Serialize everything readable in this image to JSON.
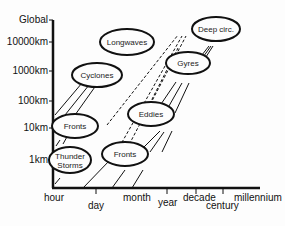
{
  "diagram": {
    "type": "space-time scale diagram",
    "y_axis": {
      "labels": [
        "Global",
        "10000km",
        "1000km",
        "100km",
        "10km",
        "1km"
      ]
    },
    "x_axis": {
      "labels": [
        "hour",
        "day",
        "month",
        "year",
        "decade",
        "century",
        "millennium"
      ]
    },
    "bubbles": [
      {
        "id": "thunderstorms",
        "label_line1": "Thunder",
        "label_line2": "Storms"
      },
      {
        "id": "fronts-atm",
        "label": "Fronts"
      },
      {
        "id": "cyclones",
        "label": "Cyclones"
      },
      {
        "id": "longwaves",
        "label": "Longwaves"
      },
      {
        "id": "fronts-ocean",
        "label": "Fronts"
      },
      {
        "id": "eddies",
        "label": "Eddies"
      },
      {
        "id": "gyres",
        "label": "Gyres"
      },
      {
        "id": "deep-circ",
        "label": "Deep circ."
      }
    ],
    "colors": {
      "line": "#111111",
      "background": "#fdfdfd"
    }
  }
}
